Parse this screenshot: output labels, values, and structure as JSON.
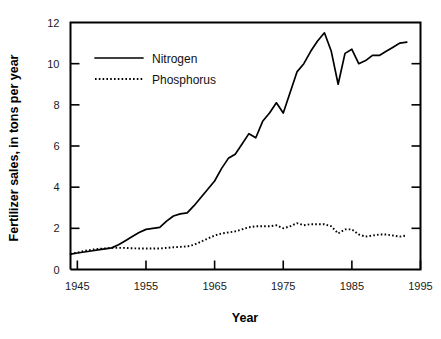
{
  "chart_data": {
    "type": "line",
    "title": "",
    "xlabel": "Year",
    "ylabel": "Fertilizer sales, in tons per year",
    "xlim": [
      1944,
      1995
    ],
    "ylim": [
      0,
      12
    ],
    "grid": false,
    "legend_position": "upper-left-inside",
    "xticks": [
      1945,
      1955,
      1965,
      1975,
      1985,
      1995
    ],
    "xticklabels": [
      "1945",
      "1955",
      "1965",
      "1975",
      "1985",
      "1995"
    ],
    "yticks": [
      0,
      2,
      4,
      6,
      8,
      10,
      12
    ],
    "yticklabels": [
      "0",
      "2",
      "4",
      "6",
      "8",
      "10",
      "12"
    ],
    "series": [
      {
        "name": "Nitrogen",
        "style": "solid",
        "color": "#000000",
        "x": [
          1944,
          1945,
          1946,
          1947,
          1948,
          1949,
          1950,
          1951,
          1952,
          1953,
          1954,
          1955,
          1956,
          1957,
          1958,
          1959,
          1960,
          1961,
          1962,
          1963,
          1964,
          1965,
          1966,
          1967,
          1968,
          1969,
          1970,
          1971,
          1972,
          1973,
          1974,
          1975,
          1976,
          1977,
          1978,
          1979,
          1980,
          1981,
          1982,
          1983,
          1984,
          1985,
          1986,
          1987,
          1988,
          1989,
          1990,
          1991,
          1992,
          1993
        ],
        "values": [
          0.75,
          0.8,
          0.85,
          0.9,
          0.95,
          1.0,
          1.05,
          1.2,
          1.4,
          1.6,
          1.8,
          1.95,
          2.0,
          2.05,
          2.35,
          2.6,
          2.7,
          2.75,
          3.1,
          3.5,
          3.9,
          4.3,
          4.9,
          5.4,
          5.6,
          6.1,
          6.6,
          6.4,
          7.2,
          7.6,
          8.1,
          7.6,
          8.6,
          9.6,
          10.0,
          10.6,
          11.1,
          11.5,
          10.6,
          9.0,
          10.5,
          10.7,
          10.0,
          10.15,
          10.4,
          10.4,
          10.6,
          10.8,
          11.0,
          11.05
        ]
      },
      {
        "name": "Phosphorus",
        "style": "dotted",
        "color": "#000000",
        "x": [
          1944,
          1945,
          1946,
          1947,
          1948,
          1949,
          1950,
          1951,
          1952,
          1953,
          1954,
          1955,
          1956,
          1957,
          1958,
          1959,
          1960,
          1961,
          1962,
          1963,
          1964,
          1965,
          1966,
          1967,
          1968,
          1969,
          1970,
          1971,
          1972,
          1973,
          1974,
          1975,
          1976,
          1977,
          1978,
          1979,
          1980,
          1981,
          1982,
          1983,
          1984,
          1985,
          1986,
          1987,
          1988,
          1989,
          1990,
          1991,
          1992,
          1993
        ],
        "values": [
          0.75,
          0.82,
          0.9,
          0.96,
          1.0,
          1.02,
          1.05,
          1.05,
          1.05,
          1.03,
          1.02,
          1.02,
          1.02,
          1.02,
          1.05,
          1.08,
          1.1,
          1.12,
          1.2,
          1.35,
          1.5,
          1.65,
          1.75,
          1.8,
          1.85,
          1.95,
          2.05,
          2.1,
          2.1,
          2.1,
          2.15,
          2.0,
          2.1,
          2.25,
          2.15,
          2.2,
          2.2,
          2.2,
          2.1,
          1.75,
          1.95,
          1.95,
          1.7,
          1.6,
          1.65,
          1.7,
          1.7,
          1.65,
          1.6,
          1.65
        ]
      }
    ],
    "legend": [
      {
        "label": "Nitrogen",
        "style": "solid"
      },
      {
        "label": "Phosphorus",
        "style": "dotted"
      }
    ]
  }
}
